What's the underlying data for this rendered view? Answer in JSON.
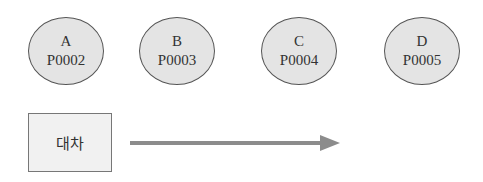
{
  "nodes": [
    {
      "label": "A",
      "code": "P0002",
      "left": 28
    },
    {
      "label": "B",
      "code": "P0003",
      "left": 139
    },
    {
      "label": "C",
      "code": "P0004",
      "left": 261
    },
    {
      "label": "D",
      "code": "P0005",
      "left": 384
    }
  ],
  "box": {
    "label": "대차"
  },
  "arrow": {
    "direction": "right",
    "color": "#8c8c8c"
  },
  "colors": {
    "node_fill": "#e4e4e4",
    "node_border": "#555555",
    "box_fill": "#f1f1f1"
  }
}
